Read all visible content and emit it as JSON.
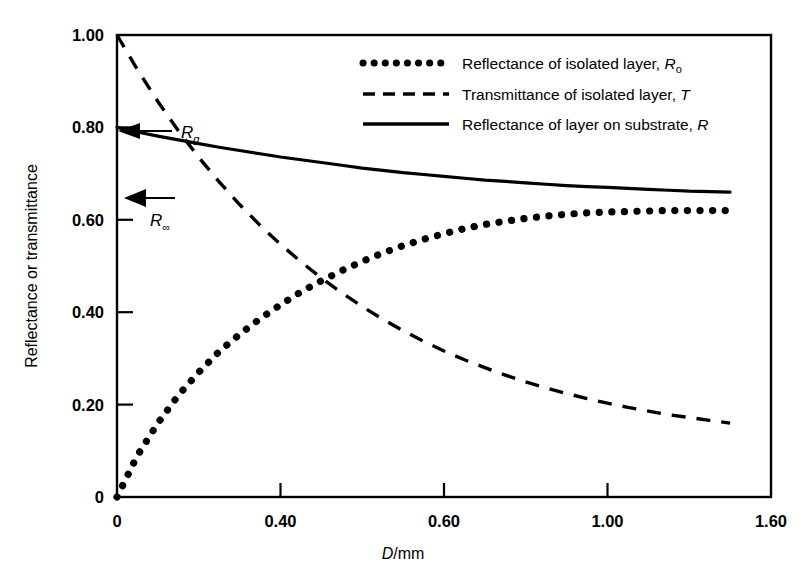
{
  "figure": {
    "background": "#ffffff",
    "ink": "#000000",
    "frame": {
      "left": 117,
      "right": 771,
      "top": 35,
      "bottom": 497
    }
  },
  "chart_data": {
    "type": "line",
    "title": "",
    "xlabel": "D/mm",
    "xlabel_italic": "D",
    "xlabel_rest": "/mm",
    "ylabel": "Reflectance or transmittance",
    "xlim": [
      0,
      1.6
    ],
    "ylim": [
      0,
      1.0
    ],
    "grid": false,
    "legend_position": "top-right-inside",
    "xticks": [
      "0",
      "0.40",
      "0.60",
      "1.00",
      "1.60"
    ],
    "xtick_values": [
      0,
      0.4,
      0.8,
      1.2,
      1.6
    ],
    "yticks": [
      "0",
      "0.20",
      "0.40",
      "0.60",
      "0.80",
      "1.00"
    ],
    "ytick_values": [
      0,
      0.2,
      0.4,
      0.6,
      0.8,
      1.0
    ],
    "series": [
      {
        "name": "Reflectance of isolated layer, R_o",
        "legend_text": "Reflectance of isolated layer, ",
        "legend_symbol": "R",
        "legend_subscript": "o",
        "style": "dotted",
        "x": [
          0.0,
          0.05,
          0.1,
          0.15,
          0.2,
          0.25,
          0.3,
          0.35,
          0.4,
          0.45,
          0.5,
          0.55,
          0.6,
          0.65,
          0.7,
          0.75,
          0.8,
          0.85,
          0.9,
          0.95,
          1.0,
          1.05,
          1.1,
          1.15,
          1.2,
          1.25,
          1.3,
          1.35,
          1.4,
          1.45,
          1.5
        ],
        "y": [
          0.0,
          0.09,
          0.16,
          0.22,
          0.27,
          0.315,
          0.352,
          0.386,
          0.416,
          0.444,
          0.468,
          0.49,
          0.51,
          0.528,
          0.544,
          0.558,
          0.57,
          0.581,
          0.59,
          0.597,
          0.603,
          0.608,
          0.612,
          0.615,
          0.617,
          0.618,
          0.619,
          0.62,
          0.62,
          0.62,
          0.62
        ]
      },
      {
        "name": "Transmittance of isolated layer, T",
        "legend_text": "Transmittance of isolated layer, ",
        "legend_symbol": "T",
        "legend_subscript": "",
        "style": "dashed",
        "x": [
          0.0,
          0.05,
          0.1,
          0.15,
          0.2,
          0.25,
          0.3,
          0.35,
          0.4,
          0.45,
          0.5,
          0.55,
          0.6,
          0.65,
          0.7,
          0.75,
          0.8,
          0.85,
          0.9,
          0.95,
          1.0,
          1.05,
          1.1,
          1.15,
          1.2,
          1.25,
          1.3,
          1.35,
          1.4,
          1.45,
          1.5
        ],
        "y": [
          1.0,
          0.925,
          0.856,
          0.793,
          0.735,
          0.682,
          0.633,
          0.588,
          0.547,
          0.509,
          0.474,
          0.442,
          0.412,
          0.385,
          0.36,
          0.337,
          0.316,
          0.297,
          0.28,
          0.264,
          0.249,
          0.236,
          0.224,
          0.213,
          0.203,
          0.194,
          0.186,
          0.178,
          0.172,
          0.166,
          0.16
        ]
      },
      {
        "name": "Reflectance of layer on substrate, R",
        "legend_text": "Reflectance of layer on substrate, ",
        "legend_symbol": "R",
        "legend_subscript": "",
        "style": "solid",
        "x": [
          0.0,
          0.05,
          0.1,
          0.15,
          0.2,
          0.25,
          0.3,
          0.35,
          0.4,
          0.45,
          0.5,
          0.55,
          0.6,
          0.65,
          0.7,
          0.75,
          0.8,
          0.85,
          0.9,
          0.95,
          1.0,
          1.05,
          1.1,
          1.15,
          1.2,
          1.25,
          1.3,
          1.35,
          1.4,
          1.45,
          1.5
        ],
        "y": [
          0.8,
          0.79,
          0.781,
          0.773,
          0.765,
          0.757,
          0.75,
          0.743,
          0.736,
          0.73,
          0.724,
          0.718,
          0.712,
          0.707,
          0.702,
          0.698,
          0.694,
          0.69,
          0.686,
          0.683,
          0.68,
          0.677,
          0.674,
          0.672,
          0.67,
          0.668,
          0.666,
          0.664,
          0.662,
          0.661,
          0.66
        ]
      }
    ],
    "annotations": [
      {
        "label": "R",
        "subscript": "g",
        "x_value": 0.0,
        "y_value": 0.8,
        "arrow": "left"
      },
      {
        "label": "R",
        "subscript": "∞",
        "x_value": 0.0,
        "y_value": 0.645,
        "arrow": "left"
      }
    ]
  }
}
